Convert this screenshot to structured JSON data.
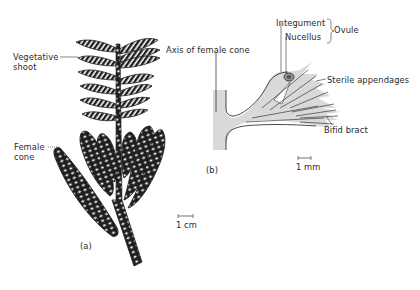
{
  "figure_a": {
    "panel_label": "(a)",
    "labels": {
      "vegetative_shoot_line1": "Vegetative",
      "vegetative_shoot_line2": "shoot",
      "female_cone_line1": "Female",
      "female_cone_line2": "cone"
    },
    "scale_bar": "1 cm"
  },
  "figure_b": {
    "panel_label": "(b)",
    "labels": {
      "axis_of_female_cone": "Axis of female cone",
      "integument": "Integument",
      "nucellus": "Nucellus",
      "ovule": "Ovule",
      "sterile_appendages": "Sterile appendages",
      "bifid_bract": "Bifid bract"
    },
    "scale_bar": "1 mm"
  },
  "colors": {
    "ink": "#1e1e1e",
    "fill_grey": "#d9d9d9",
    "background": "#ffffff"
  }
}
